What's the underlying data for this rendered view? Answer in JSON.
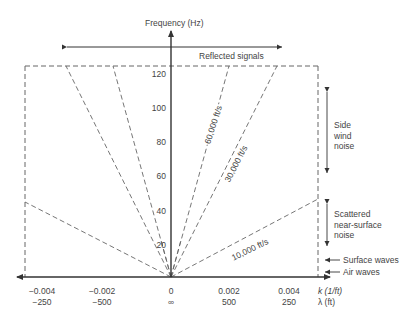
{
  "diagram": {
    "y_axis_label": "Frequency (Hz)",
    "y_ticks": [
      "120",
      "100",
      "80",
      "60",
      "40",
      "20"
    ],
    "x_axis_labels": {
      "k": "k (1/ft)",
      "lambda": "λ (ft)"
    },
    "x_ticks": [
      {
        "k": "−0.004",
        "lambda": "−250"
      },
      {
        "k": "−0.002",
        "lambda": "−500"
      },
      {
        "k": "0",
        "lambda": "∞"
      },
      {
        "k": "0.002",
        "lambda": "500"
      },
      {
        "k": "0.004",
        "lambda": "250"
      }
    ],
    "reflected_signals": "Reflected signals",
    "velocity_lines": {
      "v60000": "60,000 ft/s",
      "v30000": "30,000 ft/s",
      "v10000": "10,000 ft/s"
    },
    "annotations": {
      "side_wind_1": "Side",
      "side_wind_2": "wind",
      "side_wind_3": "noise",
      "scattered_1": "Scattered",
      "scattered_2": "near-surface",
      "scattered_3": "noise",
      "surface_waves": "Surface waves",
      "air_waves": "Air waves"
    },
    "colors": {
      "axis": "#333333",
      "dashed": "#666666",
      "text": "#444444"
    }
  }
}
